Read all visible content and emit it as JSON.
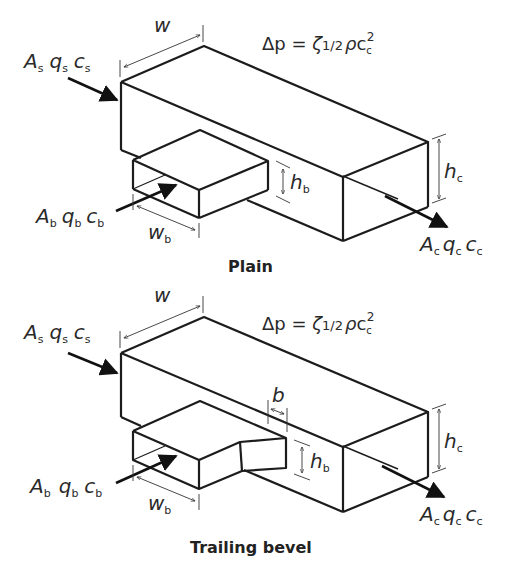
{
  "figures": [
    {
      "caption": "Plain",
      "inlet_straight": {
        "A": "A",
        "q": "q",
        "c": "c",
        "sub": "s"
      },
      "inlet_branch": {
        "A": "A",
        "q": "q",
        "c": "c",
        "sub": "b"
      },
      "outlet_combined": {
        "A": "A",
        "q": "q",
        "c": "c",
        "sub": "c"
      },
      "dimension_w": "w",
      "dimension_wb": {
        "base": "w",
        "sub": "b"
      },
      "dimension_hb": {
        "base": "h",
        "sub": "b"
      },
      "dimension_hc": {
        "base": "h",
        "sub": "c"
      },
      "formula": {
        "lhs": "Δp",
        "eq": " = ",
        "zeta": "ζ",
        "half": "1/2",
        "rho": "ρ",
        "c": "c",
        "c_sub": "c",
        "exp": "2"
      }
    },
    {
      "caption": "Trailing bevel",
      "inlet_straight": {
        "A": "A",
        "q": "q",
        "c": "c",
        "sub": "s"
      },
      "inlet_branch": {
        "A": "A",
        "q": "q",
        "c": "c",
        "sub": "b"
      },
      "outlet_combined": {
        "A": "A",
        "q": "q",
        "c": "c",
        "sub": "c"
      },
      "dimension_w": "w",
      "dimension_b": "b",
      "dimension_wb": {
        "base": "w",
        "sub": "b"
      },
      "dimension_hb": {
        "base": "h",
        "sub": "b"
      },
      "dimension_hc": {
        "base": "h",
        "sub": "c"
      },
      "formula": {
        "lhs": "Δp",
        "eq": " = ",
        "zeta": "ζ",
        "half": "1/2",
        "rho": "ρ",
        "c": "c",
        "c_sub": "c",
        "exp": "2"
      }
    }
  ]
}
